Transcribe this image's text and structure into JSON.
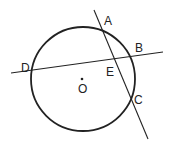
{
  "diagram": {
    "type": "circle-secants",
    "circle": {
      "center_label": "O",
      "cx": 83,
      "cy": 79,
      "r": 52
    },
    "points": [
      {
        "label": "A",
        "x": 102,
        "y": 30,
        "lx": 104,
        "ly": 25
      },
      {
        "label": "B",
        "x": 133,
        "y": 56,
        "lx": 135,
        "ly": 52
      },
      {
        "label": "C",
        "x": 131,
        "y": 97,
        "lx": 134,
        "ly": 104
      },
      {
        "label": "D",
        "x": 32,
        "y": 70,
        "lx": 21,
        "ly": 68
      },
      {
        "label": "E",
        "x": 115,
        "y": 62,
        "lx": 106,
        "ly": 76
      },
      {
        "label": "O",
        "x": 82,
        "y": 79,
        "lx": 78,
        "ly": 93
      }
    ],
    "lines": [
      {
        "name": "line-AC",
        "x1": 94,
        "y1": 10,
        "x2": 148,
        "y2": 139
      },
      {
        "name": "line-DB",
        "x1": 11,
        "y1": 73,
        "x2": 163,
        "y2": 52
      }
    ],
    "colors": {
      "stroke": "#222222",
      "background": "#ffffff"
    }
  }
}
